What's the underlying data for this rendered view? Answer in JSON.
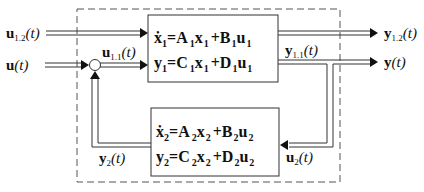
{
  "diagram": {
    "type": "block-diagram",
    "title": "",
    "outer_box": {
      "style": "dashed"
    },
    "blocks": [
      {
        "id": "system-1",
        "equations": [
          {
            "lhs": "ẋ",
            "lhs_sub": "1",
            "A": "A",
            "A_sub": "1",
            "x": "x",
            "x_sub": "1",
            "B": "B",
            "B_sub": "1",
            "u": "u",
            "u_sub": "1"
          },
          {
            "lhs": "y",
            "lhs_sub": "1",
            "A": "C",
            "A_sub": "1",
            "x": "x",
            "x_sub": "1",
            "B": "D",
            "B_sub": "1",
            "u": "u",
            "u_sub": "1"
          }
        ]
      },
      {
        "id": "system-2",
        "equations": [
          {
            "lhs": "ẋ",
            "lhs_sub": "2",
            "A": "A",
            "A_sub": "2",
            "x": "x",
            "x_sub": "2",
            "B": "B",
            "B_sub": "2",
            "u": "u",
            "u_sub": "2"
          },
          {
            "lhs": "y",
            "lhs_sub": "2",
            "A": "C",
            "A_sub": "2",
            "x": "x",
            "x_sub": "2",
            "B": "D",
            "B_sub": "2",
            "u": "u",
            "u_sub": "2"
          }
        ]
      }
    ],
    "signals": {
      "u12": {
        "base": "u",
        "sub": "1.2",
        "arg": "(t)"
      },
      "u": {
        "base": "u",
        "sub": "",
        "arg": "(t)"
      },
      "u11": {
        "base": "u",
        "sub": "1.1",
        "arg": "(t)"
      },
      "y12": {
        "base": "y",
        "sub": "1.2",
        "arg": "(t)"
      },
      "y11": {
        "base": "y",
        "sub": "1.1",
        "arg": "(t)"
      },
      "y": {
        "base": "y",
        "sub": "",
        "arg": "(t)"
      },
      "y2": {
        "base": "y",
        "sub": "2",
        "arg": "(t)"
      },
      "u2": {
        "base": "u",
        "sub": "2",
        "arg": "(t)"
      }
    },
    "summing_junction": {
      "shape": "circle"
    },
    "colors": {
      "line": "#222222",
      "background": "#ffffff"
    }
  }
}
